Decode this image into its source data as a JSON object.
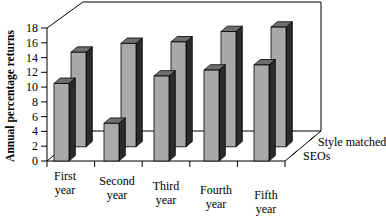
{
  "chart_data": {
    "type": "bar",
    "title": "",
    "subtitle": "",
    "xlabel": "",
    "ylabel": "Annual percentage returns",
    "zlabel": "",
    "categories": [
      "First year",
      "Second year",
      "Third year",
      "Fourth year",
      "Fifth year"
    ],
    "category_lines": [
      [
        "First",
        "year"
      ],
      [
        "Second",
        "year"
      ],
      [
        "Third",
        "year"
      ],
      [
        "Fourth",
        "year"
      ],
      [
        "Fifth",
        "year"
      ]
    ],
    "series": [
      {
        "name": "SEOs",
        "values": [
          10.5,
          5.1,
          11.5,
          12.3,
          13.0
        ]
      },
      {
        "name": "Style matched",
        "values": [
          12.8,
          14.0,
          14.2,
          15.6,
          16.2
        ]
      }
    ],
    "depth_labels": [
      "SEOs",
      "Style matched"
    ],
    "yticks": [
      0,
      2,
      4,
      6,
      8,
      10,
      12,
      14,
      16,
      18
    ],
    "ylim": [
      0,
      18
    ],
    "grid": false,
    "legend_position": "depth-axis",
    "colors": {
      "bar_front": "#a9a9a9",
      "bar_top": "#6e6e6e",
      "bar_side": "#2b2b2b",
      "axis": "#000000",
      "background": "#ffffff"
    }
  }
}
